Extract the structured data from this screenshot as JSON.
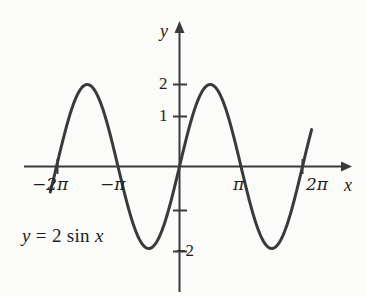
{
  "figure": {
    "background_color": "#fbfbfa",
    "ink_color": "#3a3a3a",
    "text_color": "#1d1d1d"
  },
  "chart_data": {
    "type": "line",
    "title": "",
    "annotation": "y = 2 sin x",
    "equation_parts": {
      "y": "y",
      "equals": "=",
      "coefficient": "2",
      "function": "sin",
      "variable": "x"
    },
    "xlabel": "x",
    "ylabel": "y",
    "xlim": [
      -7.33,
      7.86
    ],
    "ylim": [
      -3.28,
      3.45
    ],
    "grid": false,
    "legend": null,
    "xticks": [
      -6.283185,
      -3.141593,
      3.141593,
      6.283185
    ],
    "xticklabels": [
      "−2π",
      "−π",
      "π",
      "2π"
    ],
    "yticks": [
      2,
      1,
      -1,
      -2
    ],
    "yticklabels": [
      "2",
      "1",
      "",
      "−2"
    ],
    "series": [
      {
        "name": "y = 2 sin x",
        "expression": "2*sin(x)",
        "amplitude": 2,
        "period": 6.283185,
        "color": "#3a3a3a",
        "linewidth": 3,
        "x": [
          -6.6,
          -6.4,
          -6.283185,
          -6.0,
          -5.7,
          -5.4,
          -5.1,
          -4.712389,
          -4.4,
          -4.1,
          -3.8,
          -3.5,
          -3.141593,
          -2.8,
          -2.5,
          -2.2,
          -1.9,
          -1.570796,
          -1.3,
          -1.0,
          -0.7,
          -0.4,
          0.0,
          0.4,
          0.7,
          1.0,
          1.3,
          1.570796,
          1.9,
          2.2,
          2.5,
          2.8,
          3.141593,
          3.5,
          3.8,
          4.1,
          4.4,
          4.712389,
          5.1,
          5.4,
          5.7,
          6.0,
          6.283185,
          6.5,
          6.75
        ],
        "y": [
          -0.63,
          -0.25,
          0.0,
          0.56,
          1.11,
          1.55,
          1.85,
          2.0,
          1.93,
          1.64,
          1.24,
          0.7,
          0.0,
          -0.67,
          -1.2,
          -1.62,
          -1.89,
          -2.0,
          -1.93,
          -1.68,
          -1.29,
          -0.78,
          0.0,
          0.78,
          1.29,
          1.68,
          1.93,
          2.0,
          1.89,
          1.62,
          1.2,
          0.67,
          0.0,
          -0.7,
          -1.24,
          -1.64,
          -1.93,
          -2.0,
          -1.85,
          -1.55,
          -1.11,
          -0.56,
          0.0,
          0.43,
          0.92
        ]
      }
    ],
    "peaks": [
      {
        "x": -4.712389,
        "y": 2
      },
      {
        "x": 1.570796,
        "y": 2
      }
    ],
    "troughs": [
      {
        "x": -1.570796,
        "y": -2
      },
      {
        "x": 4.712389,
        "y": -2
      }
    ],
    "zero_crossings": [
      -6.283185,
      -3.141593,
      0,
      3.141593,
      6.283185
    ]
  },
  "axes": {
    "x_axis_name": "x",
    "y_axis_name": "y",
    "x_tick_labels": {
      "neg_two_pi": "−2π",
      "neg_pi": "−π",
      "pi": "π",
      "two_pi": "2π"
    },
    "y_tick_labels": {
      "two": "2",
      "one": "1",
      "neg_two": "−2"
    }
  }
}
